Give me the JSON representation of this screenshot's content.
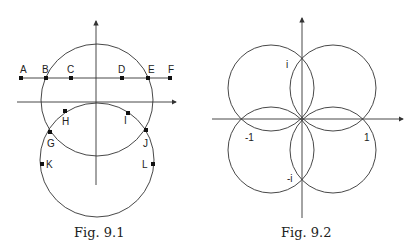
{
  "figures": [
    {
      "caption": "Fig. 9.1",
      "points": {
        "A": "A",
        "B": "B",
        "C": "C",
        "D": "D",
        "E": "E",
        "F": "F",
        "G": "G",
        "H": "H",
        "I": "I",
        "J": "J",
        "K": "K",
        "L": "L"
      }
    },
    {
      "caption": "Fig. 9.2",
      "labels": {
        "i": "i",
        "neg_i": "-i",
        "one": "1",
        "neg_one": "-1"
      }
    }
  ],
  "colors": {
    "stroke": "#333333",
    "point": "#111111"
  }
}
